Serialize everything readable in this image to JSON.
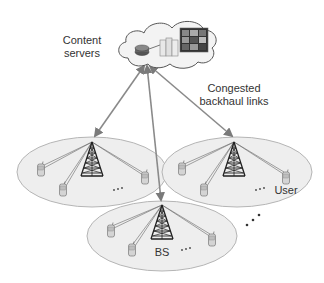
{
  "diagram": {
    "labels": {
      "content_servers_line1": "Content",
      "content_servers_line2": "servers",
      "backhaul_line1": "Congested",
      "backhaul_line2": "backhaul links",
      "user": "User",
      "bs": "BS",
      "cell_ellipsis": "...",
      "more_cells_ellipsis": "..."
    },
    "nodes": [
      {
        "id": "cloud",
        "type": "cloud",
        "contains": [
          "router-icon",
          "server-rack-icon",
          "video-content-icon"
        ]
      },
      {
        "id": "cell-left",
        "type": "cell",
        "base_station": "tower-icon",
        "users": 3
      },
      {
        "id": "cell-right",
        "type": "cell",
        "base_station": "tower-icon",
        "users": 3
      },
      {
        "id": "cell-bottom",
        "type": "cell",
        "base_station": "tower-icon",
        "users": 3
      }
    ],
    "edges": [
      {
        "from": "cloud",
        "to": "cell-left",
        "label": "backhaul"
      },
      {
        "from": "cloud",
        "to": "cell-bottom",
        "label": "backhaul"
      },
      {
        "from": "cloud",
        "to": "cell-right",
        "label": "backhaul"
      }
    ],
    "colors": {
      "link": "#8a8a8a",
      "cell_fill": "#eeeeee",
      "cell_stroke": "#b5b5b5",
      "tower": "#222222",
      "text": "#333333"
    }
  }
}
